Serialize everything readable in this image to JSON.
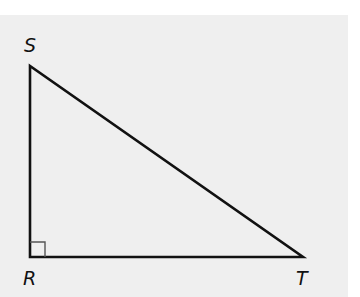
{
  "diagram": {
    "type": "right-triangle",
    "vertices": [
      {
        "name": "S",
        "label": "S",
        "x": 30,
        "y": 66
      },
      {
        "name": "R",
        "label": "R",
        "x": 30,
        "y": 257
      },
      {
        "name": "T",
        "label": "T",
        "x": 303,
        "y": 257
      }
    ],
    "right_angle_at": "R",
    "edges": [
      "SR",
      "RT",
      "ST"
    ],
    "colors": {
      "background": "#efefef",
      "stroke": "#111111",
      "right_angle_marker": "#555555"
    }
  },
  "labels": {
    "s": "S",
    "r": "R",
    "t": "T"
  }
}
